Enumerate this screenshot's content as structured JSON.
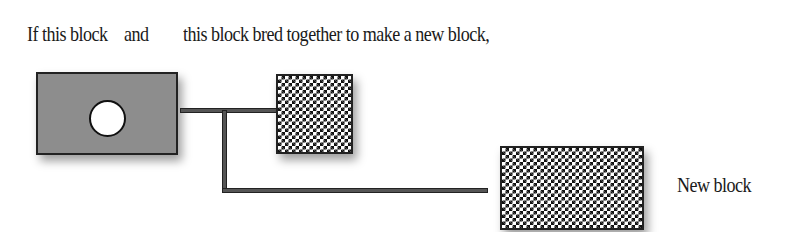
{
  "caption": {
    "part1": "If this block",
    "part2": "and",
    "part3": "this block bred together to make a new block,"
  },
  "blocks": {
    "parent_a": {
      "pattern": "gray-with-white-circle",
      "color": "#8d8d8d"
    },
    "parent_b": {
      "pattern": "small-checkerboard"
    },
    "child": {
      "pattern": "large-checkerboard",
      "label": "New block"
    }
  }
}
